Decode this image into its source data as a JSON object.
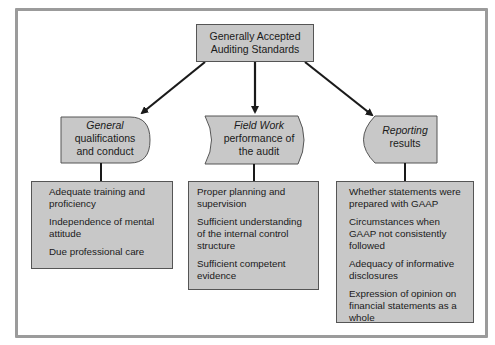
{
  "diagram": {
    "root": {
      "line1": "Generally Accepted",
      "line2": "Auditing Standards"
    },
    "categories": [
      {
        "id": "general",
        "title": "General",
        "subtitle_line1": "qualifications",
        "subtitle_line2": "and conduct",
        "items": [
          "Adequate training and proficiency",
          "Independence of mental attitude",
          "Due professional care"
        ]
      },
      {
        "id": "field-work",
        "title": "Field Work",
        "subtitle_line1": "performance of",
        "subtitle_line2": "the audit",
        "items": [
          "Proper planning and supervision",
          "Sufficient understanding of the internal control structure",
          "Sufficient competent evidence"
        ]
      },
      {
        "id": "reporting",
        "title": "Reporting",
        "subtitle_line1": "results",
        "subtitle_line2": "",
        "items": [
          "Whether statements were prepared with GAAP",
          "Circumstances when GAAP not consistently followed",
          "Adequacy of informative disclosures",
          "Expression of opinion on financial statements as a whole"
        ]
      }
    ],
    "colors": {
      "box_fill": "#c8c8c8",
      "box_border": "#555555",
      "frame": "#9b9b9b",
      "arrow": "#1a1a1a"
    }
  }
}
